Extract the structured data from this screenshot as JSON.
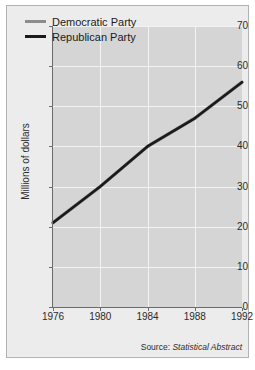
{
  "chart_data": {
    "type": "line",
    "title": "",
    "xlabel": "",
    "ylabel": "Millions of dollars",
    "x": [
      1976,
      1980,
      1984,
      1988,
      1992
    ],
    "xticklabels": [
      "1976",
      "1980",
      "1984",
      "1988",
      "1992"
    ],
    "xlim": [
      1976,
      1992
    ],
    "ylim": [
      0,
      70
    ],
    "yticks": [
      0,
      10,
      20,
      30,
      40,
      50,
      60,
      70
    ],
    "yticklabels": [
      "0",
      "10",
      "20",
      "30",
      "40",
      "50",
      "60",
      "70"
    ],
    "grid": true,
    "legend_position": "upper left",
    "series": [
      {
        "name": "Democratic Party",
        "color": "#8c8c8c",
        "values": [
          21,
          30,
          40,
          47,
          56
        ]
      },
      {
        "name": "Republican Party",
        "color": "#1a1a1a",
        "values": [
          21,
          30,
          40,
          47,
          56
        ]
      }
    ],
    "annotations": [
      {
        "name": "source-note",
        "prefix": "Source:",
        "text": "Statistical Abstract"
      }
    ]
  },
  "figure": {
    "plot_background": "#d5d5d5",
    "figure_background": "#ececec",
    "gridline_color": "#f2f2f2",
    "axis_color": "#6b6b6b"
  }
}
